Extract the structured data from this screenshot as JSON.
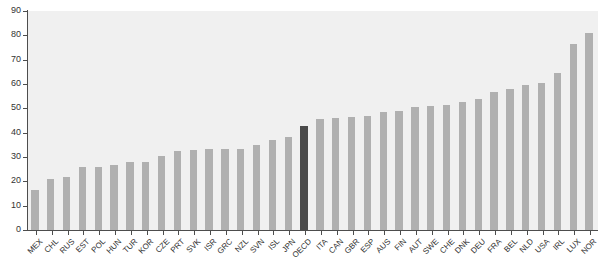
{
  "chart_data": {
    "type": "bar",
    "title": "",
    "subtitle": "",
    "xlabel": "",
    "ylabel": "",
    "ylim": [
      0,
      90
    ],
    "yticks": [
      0,
      10,
      20,
      30,
      40,
      50,
      60,
      70,
      80,
      90
    ],
    "grid": false,
    "legend": "none",
    "highlight_category": "OECD",
    "colors": {
      "bar": "#b0b0b0",
      "highlight_bar": "#4a4a4a",
      "plot_background": "#f0f0f0",
      "axis": "#4d4d4d",
      "text": "#333333",
      "page_background": "#ffffff"
    },
    "categories": [
      "MEX",
      "CHL",
      "RUS",
      "EST",
      "POL",
      "HUN",
      "TUR",
      "KOR",
      "CZE",
      "PRT",
      "SVK",
      "ISR",
      "GRC",
      "NZL",
      "SVN",
      "ISL",
      "JPN",
      "OECD",
      "ITA",
      "CAN",
      "GBR",
      "ESP",
      "AUS",
      "FIN",
      "AUT",
      "SWE",
      "CHE",
      "DNK",
      "DEU",
      "FRA",
      "BEL",
      "NLD",
      "USA",
      "IRL",
      "LUX",
      "NOR"
    ],
    "values": [
      16.4,
      20.8,
      21.8,
      25.7,
      26.1,
      26.6,
      28.0,
      28.1,
      30.5,
      32.4,
      33.0,
      33.2,
      33.3,
      33.3,
      35.0,
      37.0,
      38.3,
      42.8,
      45.5,
      46.2,
      46.5,
      47.0,
      48.3,
      49.0,
      50.5,
      50.9,
      51.3,
      52.5,
      54.0,
      56.8,
      58.0,
      59.5,
      60.5,
      64.5,
      76.5,
      81.0
    ]
  }
}
